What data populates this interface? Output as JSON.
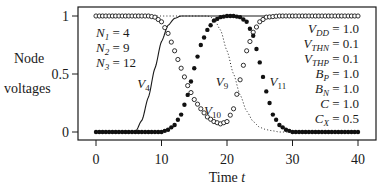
{
  "chart_data": {
    "type": "line",
    "title": "",
    "xlabel": "Time t",
    "xlabel_main": "Time",
    "xlabel_var": "t",
    "ylabel_line1": "Node",
    "ylabel_line2": "voltages",
    "xlim": [
      0,
      40
    ],
    "ylim": [
      0,
      1
    ],
    "xticks": [
      0,
      10,
      20,
      30,
      40
    ],
    "xtick_labels": [
      "0",
      "10",
      "20",
      "30",
      "40"
    ],
    "yticks": [
      0,
      0.5,
      1
    ],
    "ytick_labels": [
      "0",
      "0.5",
      "1"
    ],
    "grid": false,
    "legend": "inline curve labels",
    "params_left": [
      {
        "sym": "N",
        "sub": "1",
        "val": "= 4"
      },
      {
        "sym": "N",
        "sub": "2",
        "val": "= 9"
      },
      {
        "sym": "N",
        "sub": "3",
        "val": "= 12"
      }
    ],
    "params_right": [
      {
        "sym": "V",
        "sub": "DD",
        "val": "= 1.0"
      },
      {
        "sym": "V",
        "sub": "THN",
        "val": "= 0.1"
      },
      {
        "sym": "V",
        "sub": "THP",
        "val": "= 0.1"
      },
      {
        "sym": "B",
        "sub": "P",
        "val": "= 1.0"
      },
      {
        "sym": "B",
        "sub": "N",
        "val": "= 1.0"
      },
      {
        "sym": "C",
        "sub": "",
        "val": "= 1.0"
      },
      {
        "sym": "C",
        "sub": "X",
        "val": "= 0.5"
      }
    ],
    "series": [
      {
        "name": "V4",
        "label_sym": "V",
        "label_sub": "4",
        "style": "solid line",
        "x": [
          0,
          6,
          7,
          8,
          9,
          10,
          11,
          12,
          13,
          14,
          40
        ],
        "y": [
          0,
          0,
          0.1,
          0.3,
          0.55,
          0.78,
          0.92,
          0.98,
          1.0,
          1.0,
          1.0
        ],
        "label_pos": [
          6.3,
          0.38
        ]
      },
      {
        "name": "V9",
        "label_sym": "V",
        "label_sub": "9",
        "style": "dotted line",
        "x": [
          0,
          17,
          18,
          19,
          20,
          21,
          22,
          23,
          24,
          25,
          26,
          27,
          28,
          30,
          40
        ],
        "y": [
          1,
          1,
          0.98,
          0.88,
          0.7,
          0.5,
          0.32,
          0.18,
          0.09,
          0.04,
          0.02,
          0.01,
          0.0,
          0.0,
          0.0
        ],
        "label_pos": [
          18.3,
          0.4
        ]
      },
      {
        "name": "V10",
        "label_sym": "V",
        "label_sub": "10",
        "style": "open circles",
        "x": [
          0,
          8,
          9,
          10,
          11,
          12,
          13,
          14,
          15,
          16,
          17,
          18,
          19,
          20,
          21,
          22,
          23,
          24,
          25,
          26,
          28,
          40
        ],
        "y": [
          1,
          1,
          0.99,
          0.95,
          0.85,
          0.7,
          0.55,
          0.4,
          0.28,
          0.2,
          0.13,
          0.09,
          0.07,
          0.09,
          0.2,
          0.45,
          0.7,
          0.86,
          0.95,
          0.99,
          1.0,
          1.0
        ],
        "label_pos": [
          16.5,
          0.15
        ]
      },
      {
        "name": "V11",
        "label_sym": "V",
        "label_sub": "11",
        "style": "filled dots",
        "x": [
          0,
          10,
          11,
          12,
          13,
          14,
          15,
          16,
          17,
          18,
          19,
          20,
          21,
          22,
          23,
          24,
          25,
          26,
          27,
          28,
          29,
          30,
          40
        ],
        "y": [
          0,
          0,
          0.02,
          0.06,
          0.15,
          0.32,
          0.55,
          0.75,
          0.88,
          0.96,
          0.99,
          1.0,
          1.0,
          0.99,
          0.95,
          0.83,
          0.6,
          0.35,
          0.15,
          0.06,
          0.02,
          0.0,
          0.0
        ],
        "label_pos": [
          26.5,
          0.4
        ]
      }
    ]
  }
}
